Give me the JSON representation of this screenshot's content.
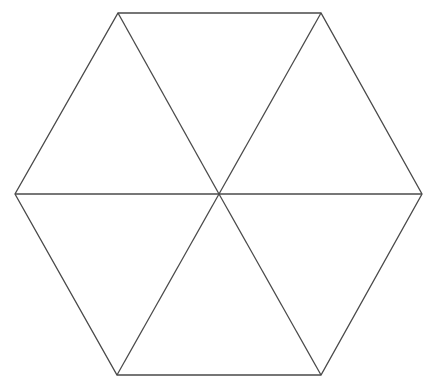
{
  "diagram": {
    "type": "hexagon-divided-into-six-triangles",
    "stroke_color": "#4a4a4a",
    "background": "#ffffff",
    "vertices": {
      "center": [
        219,
        194
      ],
      "top_left": [
        118,
        13
      ],
      "top_right": [
        321,
        13
      ],
      "right": [
        422,
        194
      ],
      "bottom_right": [
        321,
        375
      ],
      "bottom_left": [
        117,
        375
      ],
      "left": [
        15,
        194
      ]
    }
  }
}
